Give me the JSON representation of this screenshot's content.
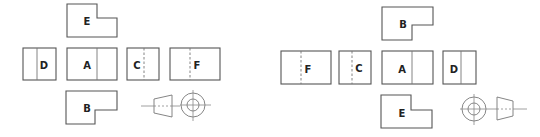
{
  "diagram": {
    "type": "orthographic-projection-comparison",
    "left_arrangement": {
      "views": [
        {
          "id": "E",
          "label": "E",
          "position": "top"
        },
        {
          "id": "D",
          "label": "D",
          "position": "left"
        },
        {
          "id": "A",
          "label": "A",
          "position": "center"
        },
        {
          "id": "C",
          "label": "C",
          "position": "right"
        },
        {
          "id": "F",
          "label": "F",
          "position": "far-right"
        },
        {
          "id": "B",
          "label": "B",
          "position": "bottom"
        }
      ],
      "symbol": "projection-symbol-cone-then-circles"
    },
    "right_arrangement": {
      "views": [
        {
          "id": "B",
          "label": "B",
          "position": "top"
        },
        {
          "id": "F",
          "label": "F",
          "position": "far-left"
        },
        {
          "id": "C",
          "label": "C",
          "position": "left"
        },
        {
          "id": "A",
          "label": "A",
          "position": "center"
        },
        {
          "id": "D",
          "label": "D",
          "position": "right"
        },
        {
          "id": "E",
          "label": "E",
          "position": "bottom"
        }
      ],
      "symbol": "projection-symbol-circles-then-cone"
    }
  },
  "labels": {
    "left": {
      "E": "E",
      "D": "D",
      "A": "A",
      "C": "C",
      "F": "F",
      "B": "B"
    },
    "right": {
      "B": "B",
      "F": "F",
      "C": "C",
      "A": "A",
      "D": "D",
      "E": "E"
    }
  },
  "colors": {
    "line": "#555555",
    "text": "#222222",
    "background": "#ffffff"
  }
}
